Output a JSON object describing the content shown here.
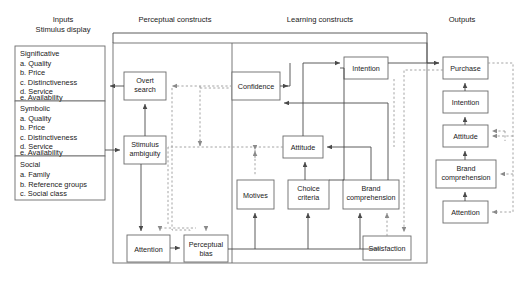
{
  "diagram": {
    "columns": [
      {
        "id": "inputs",
        "line1": "Inputs",
        "line2": "Stimulus display"
      },
      {
        "id": "perceptual",
        "line1": "Perceptual constructs",
        "line2": ""
      },
      {
        "id": "learning",
        "line1": "Learning constructs",
        "line2": ""
      },
      {
        "id": "outputs",
        "line1": "Outputs",
        "line2": ""
      }
    ],
    "input_groups": [
      {
        "name": "Significative",
        "items": [
          "a.  Quality",
          "b.  Price",
          "c.  Distinctiveness",
          "d.  Service",
          "e.  Availability"
        ]
      },
      {
        "name": "Symbolic",
        "items": [
          "a.  Quality",
          "b.  Price",
          "c.  Distinctiveness",
          "d.  Service",
          "e.  Availability"
        ]
      },
      {
        "name": "Social",
        "items": [
          "a.  Family",
          "b.  Reference groups",
          "c.  Social class"
        ]
      }
    ],
    "perceptual_nodes": [
      {
        "id": "overt-search",
        "label": "Overt\nsearch",
        "l1": "Overt",
        "l2": "search"
      },
      {
        "id": "stimulus-ambiguity",
        "label": "Stimulus ambiguity",
        "l1": "Stimulus",
        "l2": "ambiguity"
      },
      {
        "id": "attention-perceptual",
        "label": "Attention",
        "l1": "Attention",
        "l2": ""
      },
      {
        "id": "perceptual-bias",
        "label": "Perceptual bias",
        "l1": "Perceptual",
        "l2": "bias"
      }
    ],
    "learning_nodes": [
      {
        "id": "confidence",
        "label": "Confidence",
        "l1": "Confidence",
        "l2": ""
      },
      {
        "id": "intention-learning",
        "label": "Intention",
        "l1": "Intention",
        "l2": ""
      },
      {
        "id": "attitude-learning",
        "label": "Attitude",
        "l1": "Attitude",
        "l2": ""
      },
      {
        "id": "motives",
        "label": "Motives",
        "l1": "Motives",
        "l2": ""
      },
      {
        "id": "choice-criteria",
        "label": "Choice criteria",
        "l1": "Choice",
        "l2": "criteria"
      },
      {
        "id": "brand-comprehension-learning",
        "label": "Brand comprehension",
        "l1": "Brand",
        "l2": "comprehension"
      },
      {
        "id": "satisfaction",
        "label": "Satisfaction",
        "l1": "Satisfaction",
        "l2": ""
      }
    ],
    "output_nodes": [
      {
        "id": "purchase",
        "label": "Purchase",
        "l1": "Purchase",
        "l2": ""
      },
      {
        "id": "intention-output",
        "label": "Intention",
        "l1": "Intention",
        "l2": ""
      },
      {
        "id": "attitude-output",
        "label": "Attitude",
        "l1": "Attitude",
        "l2": ""
      },
      {
        "id": "brand-comprehension-output",
        "label": "Brand comprehension",
        "l1": "Brand",
        "l2": "comprehension"
      },
      {
        "id": "attention-output",
        "label": "Attention",
        "l1": "Attention",
        "l2": ""
      }
    ],
    "colors": {
      "solid_line": "#4a4a4a",
      "dashed_line": "#9a9a9a",
      "box_stroke": "#6a6a6a",
      "background": "#ffffff",
      "text": "#1a1a1a"
    }
  }
}
